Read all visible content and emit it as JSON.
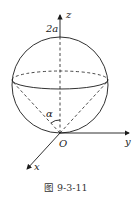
{
  "figure": {
    "labels": {
      "z_axis": "z",
      "y_axis": "y",
      "x_axis": "x",
      "origin": "O",
      "top_point": "2a",
      "angle": "α"
    },
    "caption": "图 9-3-11",
    "colors": {
      "stroke": "#1a1a1a",
      "background": "#ffffff"
    }
  }
}
